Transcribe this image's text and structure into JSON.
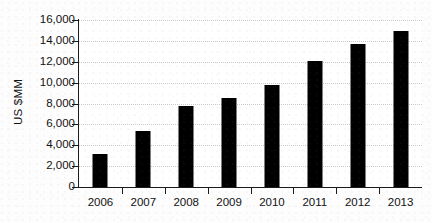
{
  "chart_data": {
    "type": "bar",
    "title": "",
    "subtitle": "",
    "xlabel": "",
    "ylabel": "US $MM",
    "categories": [
      "2006",
      "2007",
      "2008",
      "2009",
      "2010",
      "2011",
      "2012",
      "2013"
    ],
    "values": [
      3200,
      5350,
      7750,
      8550,
      9750,
      12050,
      13700,
      14950
    ],
    "series": [
      {
        "name": "",
        "values": [
          3200,
          5350,
          7750,
          8550,
          9750,
          12050,
          13700,
          14950
        ]
      }
    ],
    "ylim": [
      0,
      16000
    ],
    "ytick_values": [
      0,
      2000,
      4000,
      6000,
      8000,
      10000,
      12000,
      14000,
      16000
    ],
    "ytick_labels": [
      "0",
      "2,000",
      "4,000",
      "6,000",
      "8,000",
      "10,000",
      "12,000",
      "14,000",
      "16,000"
    ],
    "grid": true,
    "grid_axis": "y",
    "grid_style": "dotted",
    "legend": false,
    "legend_position": "none",
    "bar_color": "#000000",
    "grid_color": "#c9c9c9",
    "axis_color": "#1a1a1a",
    "background_color": "#ffffff",
    "annotations": []
  }
}
